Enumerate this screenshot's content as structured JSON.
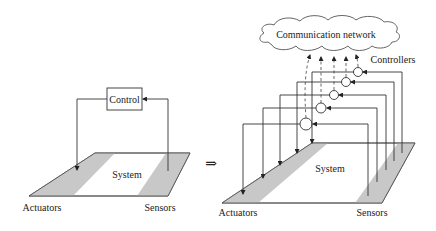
{
  "left_diagram": {
    "control_label": "Control",
    "system_label": "System",
    "actuators_label": "Actuators",
    "sensors_label": "Sensors"
  },
  "transform_symbol": "⇒",
  "right_diagram": {
    "network_label": "Communication network",
    "controllers_label": "Controllers",
    "system_label": "System",
    "actuators_label": "Actuators",
    "sensors_label": "Sensors",
    "controller_count": 5
  },
  "colors": {
    "band_fill": "#c8c8c8",
    "line": "#333333"
  }
}
